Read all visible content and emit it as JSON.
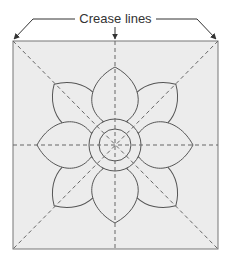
{
  "diagram": {
    "title_label": "Crease lines",
    "colors": {
      "square_fill": "#ececec",
      "square_stroke": "#777777",
      "outline": "#555555",
      "crease": "#666666",
      "label_text": "#333333"
    },
    "elements": {
      "square": "paper square",
      "creases": [
        "vertical",
        "horizontal",
        "diagonal-1",
        "diagonal-2"
      ],
      "flower": {
        "cardinal_petals": 4,
        "diagonal_petals": 4,
        "center_rings": 2
      }
    }
  }
}
